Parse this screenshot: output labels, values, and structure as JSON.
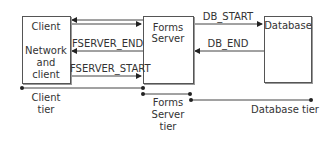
{
  "nodes": {
    "client": {
      "title": "Client",
      "sub1": "Network",
      "sub2": "and",
      "sub3": "client"
    },
    "forms_server": {
      "line1": "Forms",
      "line2": "Server"
    },
    "database": {
      "title": "Database"
    }
  },
  "edges": {
    "fserver_end": "FSERVER_END",
    "fserver_start": "FSERVER_START",
    "db_start": "DB_START",
    "db_end": "DB_END"
  },
  "tiers": {
    "client": {
      "line1": "Client",
      "line2": "tier"
    },
    "forms_server": {
      "line1": "Forms",
      "line2": "Server",
      "line3": "tier"
    },
    "database": {
      "label": "Database tier"
    }
  }
}
